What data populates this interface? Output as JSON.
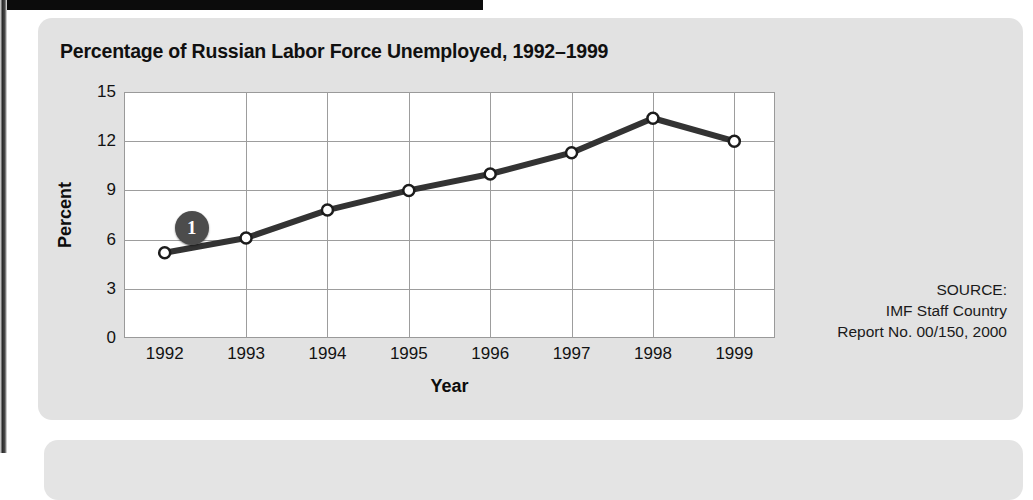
{
  "panel": {
    "title": "Percentage of Russian Labor Force Unemployed, 1992–1999"
  },
  "callout": {
    "label": "1"
  },
  "source": {
    "line1": "SOURCE:",
    "line2": "IMF Staff Country",
    "line3": "Report No. 00/150, 2000"
  },
  "colors": {
    "panel_background": "#e2e2e2",
    "plot_background": "#ffffff",
    "gridline": "#9d9d9d",
    "series_line": "#333333",
    "marker_fill": "#ffffff",
    "marker_stroke": "#1c1c1c",
    "callout_fill": "#4c4c4c",
    "header_bar": "#0c0c0c"
  },
  "chart_data": {
    "type": "line",
    "title": "Percentage of Russian Labor Force Unemployed, 1992–1999",
    "xlabel": "Year",
    "ylabel": "Percent",
    "categories": [
      "1992",
      "1993",
      "1994",
      "1995",
      "1996",
      "1997",
      "1998",
      "1999"
    ],
    "values": [
      5.2,
      6.1,
      7.8,
      9.0,
      10.0,
      11.3,
      13.4,
      12.0
    ],
    "ylim": [
      0,
      15
    ],
    "yticks": [
      0,
      3,
      6,
      9,
      12,
      15
    ],
    "ytick_labels": [
      "0",
      "3",
      "6",
      "9",
      "12",
      "15"
    ],
    "grid": true,
    "legend": "none",
    "marker": "open-circle",
    "annotations": [
      {
        "label": "1",
        "near_category": "1992",
        "shape": "filled-circle-badge"
      }
    ]
  }
}
